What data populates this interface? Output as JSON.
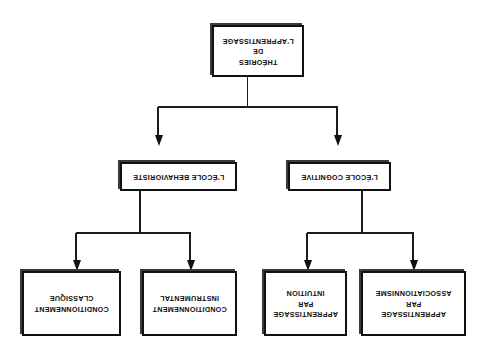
{
  "diagram": {
    "title_text": "THÉORIES DE L'APPRENTISSAGE",
    "orientation": "rotated-180",
    "background_color": "#ffffff",
    "line_color": "#1b1b1b",
    "box_border_color": "#111111",
    "box_fill_color": "#ffffff",
    "shadow_color": "#3a3a3a",
    "root": {
      "id": "theories-de-l-apprentissage",
      "label": "THÉORIES\nDE\nL'APPRENTISSAGE"
    },
    "branches": [
      {
        "id": "ecole-cognitive",
        "label": "L'ÉCOLE COGNITIVE",
        "children": [
          {
            "id": "apprentissage-par-associationnisme",
            "label": "APPRENTISSAGE\nPAR\nASSOCIATIONNISME"
          },
          {
            "id": "apprentissage-par-intuition",
            "label": "APPRENTISSAGE\nPAR\nINTUITION"
          }
        ]
      },
      {
        "id": "ecole-behavioriste",
        "label": "L'ÉCOLE BEHAVIORISTE",
        "children": [
          {
            "id": "conditionnement-instrumental",
            "label": "CONDITIONNEMENT\nINSTRUMENTAL"
          },
          {
            "id": "conditionnement-classique",
            "label": "CONDITIONNEMENT\nCLASSIQUE"
          }
        ]
      }
    ]
  }
}
